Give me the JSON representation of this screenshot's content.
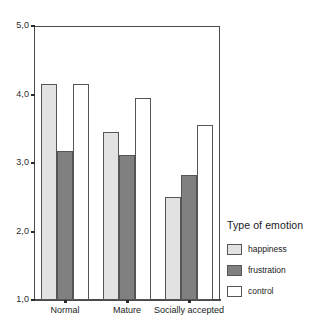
{
  "chart_data": {
    "type": "bar",
    "title": "",
    "xlabel": "",
    "ylabel": "",
    "categories": [
      "Normal",
      "Mature",
      "Socially accepted"
    ],
    "series": [
      {
        "name": "happiness",
        "color": "#e2e2e2",
        "values": [
          4.15,
          3.46,
          2.5
        ]
      },
      {
        "name": "frustration",
        "color": "#808080",
        "values": [
          3.17,
          3.12,
          2.82
        ]
      },
      {
        "name": "control",
        "color": "#ffffff",
        "values": [
          4.15,
          3.95,
          3.56
        ]
      }
    ],
    "ylim": [
      1.0,
      5.0
    ],
    "ytick_values": [
      1.0,
      2.0,
      3.0,
      4.0,
      5.0
    ],
    "ytick_labels": [
      "1,0",
      "2,0",
      "3,0",
      "4,0",
      "5,0"
    ],
    "grid": false,
    "legend": {
      "title": "Type of emotion",
      "position": "right",
      "entries": [
        {
          "label": "happiness",
          "color": "#e2e2e2"
        },
        {
          "label": "frustration",
          "color": "#808080"
        },
        {
          "label": "control",
          "color": "#ffffff"
        }
      ]
    }
  }
}
